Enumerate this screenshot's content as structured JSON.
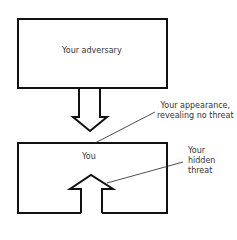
{
  "diagram": {
    "top_box": {
      "label": "Your adversary"
    },
    "bottom_box": {
      "label": "You"
    },
    "annotations": {
      "appearance": [
        "Your appearance,",
        "revealing no threat"
      ],
      "hidden_threat": [
        "Your",
        "hidden",
        "threat"
      ]
    },
    "colors": {
      "stroke": "#111111",
      "text": "#333333",
      "background": "#ffffff"
    }
  }
}
